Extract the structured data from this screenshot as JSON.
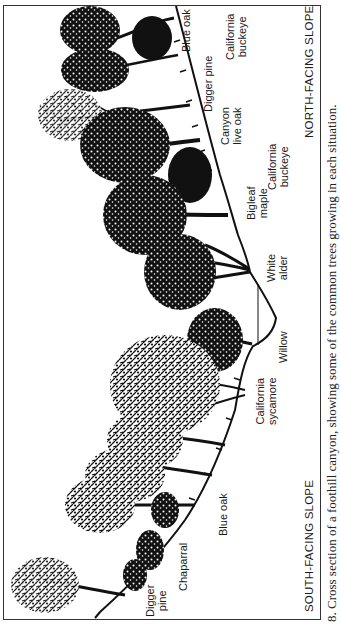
{
  "figure": {
    "caption": "8.  Cross section of a foothill canyon, showing some of the common trees growing in each situation.",
    "orientation": "rotated 90° clockwise"
  },
  "slopes": {
    "north": "NORTH-FACING SLOPE",
    "south": "SOUTH-FACING SLOPE"
  },
  "labels": {
    "blue_oak_north": {
      "line1": "Blue oak",
      "line2": ""
    },
    "buckeye_north_top": {
      "line1": "California",
      "line2": "buckeye"
    },
    "digger_pine_north": {
      "line1": "Digger pine",
      "line2": ""
    },
    "canyon_live_oak": {
      "line1": "Canyon",
      "line2": "live oak"
    },
    "buckeye_north_mid": {
      "line1": "California",
      "line2": "buckeye"
    },
    "bigleaf_maple": {
      "line1": "Bigleaf",
      "line2": "maple"
    },
    "white_alder": {
      "line1": "White",
      "line2": "alder"
    },
    "willow": {
      "line1": "Willow",
      "line2": ""
    },
    "california_sycamore": {
      "line1": "California",
      "line2": "sycamore"
    },
    "blue_oak_south": {
      "line1": "Blue oak",
      "line2": ""
    },
    "chaparral": {
      "line1": "Chaparral",
      "line2": ""
    },
    "digger_pine_south": {
      "line1": "Digger",
      "line2": "pine"
    }
  },
  "colors": {
    "ink": "#111111",
    "paper": "#ffffff",
    "frame": "#333333"
  }
}
